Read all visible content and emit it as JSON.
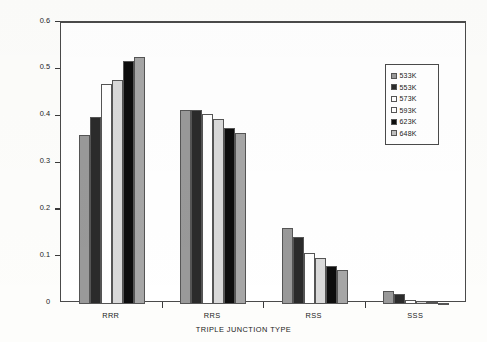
{
  "chart_data": {
    "type": "bar",
    "title": "",
    "xlabel": "TRIPLE JUNCTION TYPE",
    "ylabel": "FRACTION",
    "categories": [
      "RRR",
      "RRS",
      "RSS",
      "SSS"
    ],
    "ylim": [
      0,
      0.6
    ],
    "ytick_labels": [
      "0",
      "0.1",
      "0.2",
      "0.3",
      "0.4",
      "0.5",
      "0.6"
    ],
    "ytick_values": [
      0,
      0.1,
      0.2,
      0.3,
      0.4,
      0.5,
      0.6
    ],
    "grid": false,
    "legend_position": "upper-right",
    "series": [
      {
        "name": "533K",
        "color": "#999999",
        "values": [
          0.36,
          0.415,
          0.163,
          0.028
        ]
      },
      {
        "name": "553K",
        "color": "#2b2b2b",
        "values": [
          0.4,
          0.414,
          0.143,
          0.021
        ]
      },
      {
        "name": "573K",
        "color": "#ffffff",
        "values": [
          0.47,
          0.406,
          0.108,
          0.009
        ]
      },
      {
        "name": "593K",
        "color": "#d9d9d9",
        "values": [
          0.478,
          0.395,
          0.098,
          0.006
        ]
      },
      {
        "name": "623K",
        "color": "#0d0d0d",
        "values": [
          0.518,
          0.375,
          0.081,
          0.004
        ]
      },
      {
        "name": "648K",
        "color": "#a6a6a6",
        "values": [
          0.527,
          0.366,
          0.073,
          0.003
        ]
      }
    ]
  },
  "legend": {
    "items": [
      {
        "label": "533K"
      },
      {
        "label": "553K"
      },
      {
        "label": "573K"
      },
      {
        "label": "593K"
      },
      {
        "label": "623K"
      },
      {
        "label": "648K"
      }
    ]
  },
  "axes": {
    "y_title": "FRACTION",
    "x_title": "TRIPLE JUNCTION TYPE"
  }
}
